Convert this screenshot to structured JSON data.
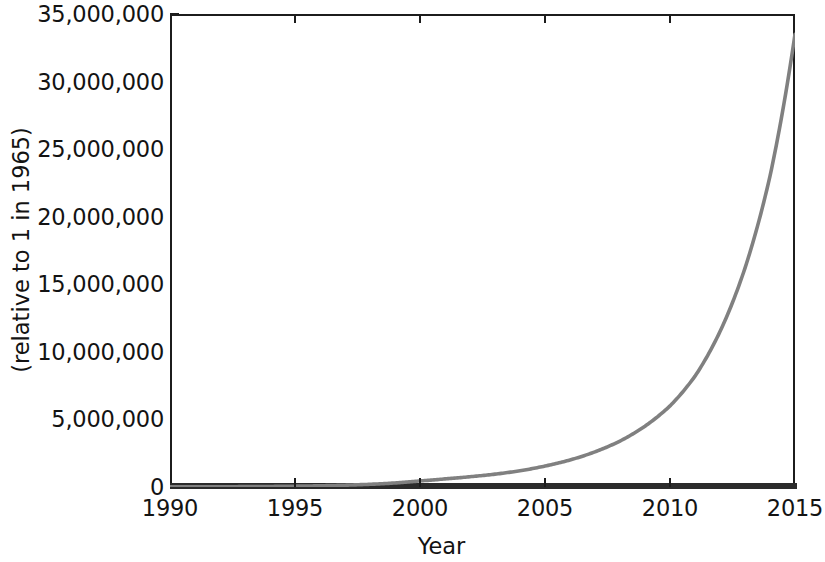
{
  "chart_data": {
    "type": "line",
    "title": "",
    "xlabel": "Year",
    "ylabel": "(relative to 1 in 1965)",
    "xlim": [
      1990,
      2015
    ],
    "ylim": [
      0,
      35000000
    ],
    "grid": false,
    "legend": null,
    "series": [
      {
        "name": "",
        "color": "#808080",
        "x": [
          1990,
          1991,
          1992,
          1993,
          1994,
          1995,
          1996,
          1997,
          1998,
          1999,
          2000,
          2001,
          2002,
          2003,
          2004,
          2005,
          2006,
          2007,
          2008,
          2009,
          2010,
          2011,
          2012,
          2013,
          2014,
          2015
        ],
        "values": [
          8000,
          12000,
          18000,
          27000,
          40000,
          60000,
          90000,
          135000,
          200000,
          300000,
          450000,
          600000,
          760000,
          950000,
          1200000,
          1550000,
          2000000,
          2600000,
          3400000,
          4500000,
          6000000,
          8200000,
          11500000,
          16200000,
          23000000,
          33500000
        ]
      }
    ],
    "x_ticks": [
      {
        "value": 1990,
        "label": "1990"
      },
      {
        "value": 1995,
        "label": "1995"
      },
      {
        "value": 2000,
        "label": "2000"
      },
      {
        "value": 2005,
        "label": "2005"
      },
      {
        "value": 2010,
        "label": "2010"
      },
      {
        "value": 2015,
        "label": "2015"
      }
    ],
    "y_ticks": [
      {
        "value": 0,
        "label": "0"
      },
      {
        "value": 5000000,
        "label": "5,000,000"
      },
      {
        "value": 10000000,
        "label": "10,000,000"
      },
      {
        "value": 15000000,
        "label": "15,000,000"
      },
      {
        "value": 20000000,
        "label": "20,000,000"
      },
      {
        "value": 25000000,
        "label": "25,000,000"
      },
      {
        "value": 30000000,
        "label": "30,000,000"
      },
      {
        "value": 35000000,
        "label": "35,000,000"
      }
    ],
    "colors": {
      "curve": "#808080",
      "axis": "#1c1c1c",
      "bottom_axis": "#2b2b2b",
      "text": "#131313",
      "background": "#ffffff"
    }
  }
}
